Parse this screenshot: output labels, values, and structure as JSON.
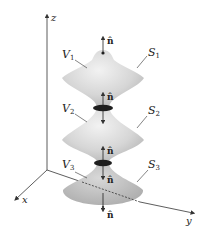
{
  "figure": {
    "axes": {
      "z_label": "z",
      "x_label": "x",
      "y_label": "y"
    },
    "volumes": [
      {
        "label": "V",
        "sub": "1"
      },
      {
        "label": "V",
        "sub": "2"
      },
      {
        "label": "V",
        "sub": "3"
      }
    ],
    "surfaces": [
      {
        "label": "S",
        "sub": "1"
      },
      {
        "label": "S",
        "sub": "2"
      },
      {
        "label": "S",
        "sub": "3"
      }
    ],
    "normal_label": "n̂",
    "colors": {
      "body_fill": "#d9d9d9",
      "body_shadow": "#bdbdbd",
      "interface_disk": "#1e1e1e",
      "axis": "#333333"
    }
  }
}
